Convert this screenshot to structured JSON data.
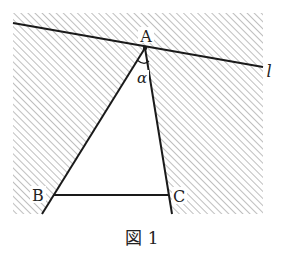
{
  "figure": {
    "caption": "図 1",
    "labels": {
      "A": "A",
      "B": "B",
      "C": "C",
      "line": "l",
      "angle": "α"
    },
    "points": {
      "A": [
        145,
        48
      ],
      "B": [
        54,
        195
      ],
      "C": [
        169,
        195
      ]
    },
    "hatch_region": {
      "x": 13,
      "y": 13,
      "width": 250,
      "height": 201
    },
    "line_l": {
      "from": [
        13,
        23
      ],
      "to": [
        263,
        67
      ]
    },
    "colors": {
      "stroke": "#1a1a1a",
      "hatch": "#8a8a8a",
      "background": "#ffffff"
    }
  }
}
